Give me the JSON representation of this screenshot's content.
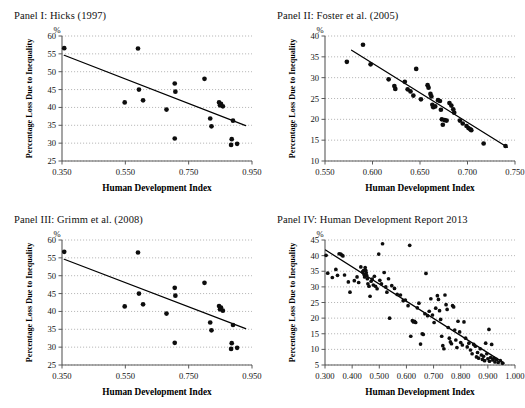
{
  "figure": {
    "common_xlabel": "Human Development Index",
    "common_ylabel": "Percentage Loss Due to Inequality",
    "percent_symbol": "%"
  },
  "chart_data": [
    {
      "type": "scatter",
      "panel_id": "I",
      "title": "Panel I: Hicks (1997)",
      "xlabel": "Human Development Index",
      "ylabel": "Percentage Loss Due to Inequality",
      "y_unit": "%",
      "xlim": [
        0.35,
        0.95
      ],
      "ylim": [
        25,
        60
      ],
      "xticks": [
        "0.350",
        "0.550",
        "0.750",
        "0.950"
      ],
      "xtick_values": [
        0.35,
        0.55,
        0.75,
        0.95
      ],
      "yticks": [
        "25",
        "30",
        "35",
        "40",
        "45",
        "50",
        "55",
        "60"
      ],
      "ytick_values": [
        25,
        30,
        35,
        40,
        45,
        50,
        55,
        60
      ],
      "grid": true,
      "grid_axis": "y",
      "legend": "none",
      "trendline": {
        "x": [
          0.357,
          0.93
        ],
        "y": [
          54.6,
          34.9
        ]
      },
      "points": [
        {
          "x": 0.357,
          "y": 56.6
        },
        {
          "x": 0.548,
          "y": 41.4
        },
        {
          "x": 0.59,
          "y": 56.5
        },
        {
          "x": 0.593,
          "y": 45.0
        },
        {
          "x": 0.606,
          "y": 42.0
        },
        {
          "x": 0.68,
          "y": 39.4
        },
        {
          "x": 0.706,
          "y": 46.7
        },
        {
          "x": 0.708,
          "y": 44.4
        },
        {
          "x": 0.706,
          "y": 31.3
        },
        {
          "x": 0.8,
          "y": 48.0
        },
        {
          "x": 0.818,
          "y": 36.9
        },
        {
          "x": 0.822,
          "y": 34.7
        },
        {
          "x": 0.846,
          "y": 41.4
        },
        {
          "x": 0.852,
          "y": 41.0
        },
        {
          "x": 0.849,
          "y": 40.6
        },
        {
          "x": 0.858,
          "y": 40.3
        },
        {
          "x": 0.89,
          "y": 36.3
        },
        {
          "x": 0.886,
          "y": 31.1
        },
        {
          "x": 0.884,
          "y": 29.5
        },
        {
          "x": 0.903,
          "y": 29.8
        }
      ]
    },
    {
      "type": "scatter",
      "panel_id": "II",
      "title": "Panel II: Foster et al. (2005)",
      "xlabel": "Human Development Index",
      "ylabel": "Percentage Loss Due to Inequality",
      "y_unit": "%",
      "xlim": [
        0.55,
        0.75
      ],
      "ylim": [
        10,
        40
      ],
      "xticks": [
        "0.550",
        "0.600",
        "0.650",
        "0.700",
        "0.750"
      ],
      "xtick_values": [
        0.55,
        0.6,
        0.65,
        0.7,
        0.75
      ],
      "yticks": [
        "10",
        "15",
        "20",
        "25",
        "30",
        "35",
        "40"
      ],
      "ytick_values": [
        10,
        15,
        20,
        25,
        30,
        35,
        40
      ],
      "grid": true,
      "grid_axis": "y",
      "legend": "none",
      "trendline": {
        "x": [
          0.578,
          0.742
        ],
        "y": [
          36.6,
          13.3
        ]
      },
      "points": [
        {
          "x": 0.573,
          "y": 33.8
        },
        {
          "x": 0.59,
          "y": 37.9
        },
        {
          "x": 0.598,
          "y": 33.2
        },
        {
          "x": 0.617,
          "y": 29.6
        },
        {
          "x": 0.623,
          "y": 28.0
        },
        {
          "x": 0.624,
          "y": 27.3
        },
        {
          "x": 0.634,
          "y": 29.0
        },
        {
          "x": 0.637,
          "y": 27.2
        },
        {
          "x": 0.64,
          "y": 26.7
        },
        {
          "x": 0.643,
          "y": 25.7
        },
        {
          "x": 0.646,
          "y": 32.1
        },
        {
          "x": 0.651,
          "y": 24.8
        },
        {
          "x": 0.658,
          "y": 28.2
        },
        {
          "x": 0.659,
          "y": 27.6
        },
        {
          "x": 0.661,
          "y": 26.1
        },
        {
          "x": 0.662,
          "y": 25.5
        },
        {
          "x": 0.663,
          "y": 23.5
        },
        {
          "x": 0.664,
          "y": 22.9
        },
        {
          "x": 0.666,
          "y": 23.1
        },
        {
          "x": 0.669,
          "y": 24.6
        },
        {
          "x": 0.671,
          "y": 24.4
        },
        {
          "x": 0.672,
          "y": 22.3
        },
        {
          "x": 0.673,
          "y": 20.0
        },
        {
          "x": 0.674,
          "y": 18.7
        },
        {
          "x": 0.676,
          "y": 19.8
        },
        {
          "x": 0.678,
          "y": 19.7
        },
        {
          "x": 0.681,
          "y": 23.9
        },
        {
          "x": 0.683,
          "y": 23.3
        },
        {
          "x": 0.685,
          "y": 22.4
        },
        {
          "x": 0.686,
          "y": 21.6
        },
        {
          "x": 0.692,
          "y": 19.7
        },
        {
          "x": 0.695,
          "y": 19.0
        },
        {
          "x": 0.699,
          "y": 18.4
        },
        {
          "x": 0.701,
          "y": 17.9
        },
        {
          "x": 0.703,
          "y": 17.6
        },
        {
          "x": 0.704,
          "y": 17.4
        },
        {
          "x": 0.717,
          "y": 14.2
        },
        {
          "x": 0.74,
          "y": 13.6
        }
      ]
    },
    {
      "type": "scatter",
      "panel_id": "III",
      "title": "Panel III: Grimm et al. (2008)",
      "xlabel": "Human Development Index",
      "ylabel": "Percentage Loss Due to Inequality",
      "y_unit": "%",
      "xlim": [
        0.35,
        0.95
      ],
      "ylim": [
        25,
        60
      ],
      "xticks": [
        "0.350",
        "0.550",
        "0.750",
        "0.950"
      ],
      "xtick_values": [
        0.35,
        0.55,
        0.75,
        0.95
      ],
      "yticks": [
        "25",
        "30",
        "35",
        "40",
        "45",
        "50",
        "55",
        "60"
      ],
      "ytick_values": [
        25,
        30,
        35,
        40,
        45,
        50,
        55,
        60
      ],
      "grid": true,
      "grid_axis": "y",
      "legend": "none",
      "trendline": {
        "x": [
          0.357,
          0.93
        ],
        "y": [
          54.6,
          35.2
        ]
      },
      "points": [
        {
          "x": 0.357,
          "y": 56.7
        },
        {
          "x": 0.548,
          "y": 41.4
        },
        {
          "x": 0.59,
          "y": 56.5
        },
        {
          "x": 0.593,
          "y": 45.0
        },
        {
          "x": 0.606,
          "y": 42.0
        },
        {
          "x": 0.68,
          "y": 39.4
        },
        {
          "x": 0.706,
          "y": 46.6
        },
        {
          "x": 0.708,
          "y": 44.4
        },
        {
          "x": 0.706,
          "y": 31.2
        },
        {
          "x": 0.8,
          "y": 48.0
        },
        {
          "x": 0.818,
          "y": 36.9
        },
        {
          "x": 0.822,
          "y": 34.7
        },
        {
          "x": 0.846,
          "y": 41.5
        },
        {
          "x": 0.852,
          "y": 41.1
        },
        {
          "x": 0.849,
          "y": 40.6
        },
        {
          "x": 0.858,
          "y": 40.2
        },
        {
          "x": 0.89,
          "y": 36.2
        },
        {
          "x": 0.886,
          "y": 31.1
        },
        {
          "x": 0.884,
          "y": 29.5
        },
        {
          "x": 0.903,
          "y": 29.8
        }
      ]
    },
    {
      "type": "scatter",
      "panel_id": "IV",
      "title": "Panel IV: Human Development Report 2013",
      "xlabel": "Human Development Index",
      "ylabel": "Percentage Loss Due to Inequality",
      "y_unit": "%",
      "xlim": [
        0.3,
        1.0
      ],
      "ylim": [
        5,
        45
      ],
      "xticks": [
        "0.300",
        "0.400",
        "0.500",
        "0.600",
        "0.700",
        "0.800",
        "0.900",
        "1.000"
      ],
      "xtick_values": [
        0.3,
        0.4,
        0.5,
        0.6,
        0.7,
        0.8,
        0.9,
        1.0
      ],
      "yticks": [
        "5",
        "10",
        "15",
        "20",
        "25",
        "30",
        "35",
        "40",
        "45"
      ],
      "ytick_values": [
        5,
        10,
        15,
        20,
        25,
        30,
        35,
        40,
        45
      ],
      "grid": true,
      "grid_axis": "y",
      "legend": "none",
      "trendline": {
        "x": [
          0.302,
          0.96
        ],
        "y": [
          41.8,
          5.6
        ]
      },
      "points": [
        {
          "x": 0.304,
          "y": 40.1
        },
        {
          "x": 0.31,
          "y": 34.4
        },
        {
          "x": 0.327,
          "y": 33.0
        },
        {
          "x": 0.34,
          "y": 35.6
        },
        {
          "x": 0.346,
          "y": 33.7
        },
        {
          "x": 0.352,
          "y": 40.6
        },
        {
          "x": 0.358,
          "y": 40.5
        },
        {
          "x": 0.362,
          "y": 40.2
        },
        {
          "x": 0.366,
          "y": 39.9
        },
        {
          "x": 0.372,
          "y": 33.8
        },
        {
          "x": 0.386,
          "y": 31.6
        },
        {
          "x": 0.392,
          "y": 28.3
        },
        {
          "x": 0.408,
          "y": 32.0
        },
        {
          "x": 0.418,
          "y": 33.2
        },
        {
          "x": 0.424,
          "y": 31.4
        },
        {
          "x": 0.432,
          "y": 36.4
        },
        {
          "x": 0.438,
          "y": 34.8
        },
        {
          "x": 0.442,
          "y": 35.2
        },
        {
          "x": 0.444,
          "y": 34.0
        },
        {
          "x": 0.446,
          "y": 33.2
        },
        {
          "x": 0.448,
          "y": 36.2
        },
        {
          "x": 0.45,
          "y": 35.3
        },
        {
          "x": 0.452,
          "y": 34.5
        },
        {
          "x": 0.454,
          "y": 33.6
        },
        {
          "x": 0.456,
          "y": 32.6
        },
        {
          "x": 0.458,
          "y": 31.0
        },
        {
          "x": 0.462,
          "y": 30.2
        },
        {
          "x": 0.466,
          "y": 27.0
        },
        {
          "x": 0.47,
          "y": 31.8
        },
        {
          "x": 0.474,
          "y": 32.5
        },
        {
          "x": 0.478,
          "y": 30.6
        },
        {
          "x": 0.482,
          "y": 33.4
        },
        {
          "x": 0.486,
          "y": 30.2
        },
        {
          "x": 0.492,
          "y": 29.4
        },
        {
          "x": 0.498,
          "y": 40.5
        },
        {
          "x": 0.502,
          "y": 32.1
        },
        {
          "x": 0.508,
          "y": 31.0
        },
        {
          "x": 0.512,
          "y": 43.8
        },
        {
          "x": 0.518,
          "y": 34.6
        },
        {
          "x": 0.524,
          "y": 30.0
        },
        {
          "x": 0.528,
          "y": 28.3
        },
        {
          "x": 0.534,
          "y": 32.6
        },
        {
          "x": 0.538,
          "y": 20.0
        },
        {
          "x": 0.546,
          "y": 30.4
        },
        {
          "x": 0.556,
          "y": 29.5
        },
        {
          "x": 0.566,
          "y": 27.6
        },
        {
          "x": 0.578,
          "y": 27.4
        },
        {
          "x": 0.588,
          "y": 25.6
        },
        {
          "x": 0.596,
          "y": 25.8
        },
        {
          "x": 0.606,
          "y": 24.0
        },
        {
          "x": 0.612,
          "y": 43.3
        },
        {
          "x": 0.616,
          "y": 14.2
        },
        {
          "x": 0.622,
          "y": 19.2
        },
        {
          "x": 0.626,
          "y": 18.8
        },
        {
          "x": 0.63,
          "y": 19.0
        },
        {
          "x": 0.634,
          "y": 18.6
        },
        {
          "x": 0.64,
          "y": 23.3
        },
        {
          "x": 0.646,
          "y": 24.8
        },
        {
          "x": 0.652,
          "y": 11.7
        },
        {
          "x": 0.658,
          "y": 15.0
        },
        {
          "x": 0.662,
          "y": 14.8
        },
        {
          "x": 0.668,
          "y": 21.4
        },
        {
          "x": 0.672,
          "y": 34.3
        },
        {
          "x": 0.678,
          "y": 20.8
        },
        {
          "x": 0.684,
          "y": 22.2
        },
        {
          "x": 0.69,
          "y": 26.2
        },
        {
          "x": 0.696,
          "y": 21.0
        },
        {
          "x": 0.702,
          "y": 18.6
        },
        {
          "x": 0.708,
          "y": 23.2
        },
        {
          "x": 0.714,
          "y": 27.2
        },
        {
          "x": 0.718,
          "y": 26.0
        },
        {
          "x": 0.722,
          "y": 22.4
        },
        {
          "x": 0.726,
          "y": 19.6
        },
        {
          "x": 0.73,
          "y": 14.2
        },
        {
          "x": 0.734,
          "y": 11.2
        },
        {
          "x": 0.738,
          "y": 10.2
        },
        {
          "x": 0.742,
          "y": 27.4
        },
        {
          "x": 0.746,
          "y": 24.3
        },
        {
          "x": 0.75,
          "y": 22.8
        },
        {
          "x": 0.754,
          "y": 17.0
        },
        {
          "x": 0.758,
          "y": 13.6
        },
        {
          "x": 0.762,
          "y": 12.4
        },
        {
          "x": 0.766,
          "y": 11.8
        },
        {
          "x": 0.77,
          "y": 24.0
        },
        {
          "x": 0.774,
          "y": 23.6
        },
        {
          "x": 0.778,
          "y": 16.2
        },
        {
          "x": 0.782,
          "y": 13.0
        },
        {
          "x": 0.786,
          "y": 10.6
        },
        {
          "x": 0.79,
          "y": 19.0
        },
        {
          "x": 0.796,
          "y": 15.6
        },
        {
          "x": 0.8,
          "y": 12.2
        },
        {
          "x": 0.806,
          "y": 11.4
        },
        {
          "x": 0.812,
          "y": 18.8
        },
        {
          "x": 0.818,
          "y": 13.6
        },
        {
          "x": 0.824,
          "y": 10.8
        },
        {
          "x": 0.83,
          "y": 12.0
        },
        {
          "x": 0.836,
          "y": 9.8
        },
        {
          "x": 0.842,
          "y": 8.6
        },
        {
          "x": 0.848,
          "y": 11.6
        },
        {
          "x": 0.854,
          "y": 11.0
        },
        {
          "x": 0.858,
          "y": 7.6
        },
        {
          "x": 0.862,
          "y": 9.0
        },
        {
          "x": 0.866,
          "y": 7.2
        },
        {
          "x": 0.872,
          "y": 10.2
        },
        {
          "x": 0.876,
          "y": 8.2
        },
        {
          "x": 0.88,
          "y": 6.8
        },
        {
          "x": 0.884,
          "y": 7.8
        },
        {
          "x": 0.888,
          "y": 6.4
        },
        {
          "x": 0.892,
          "y": 12.0
        },
        {
          "x": 0.896,
          "y": 8.6
        },
        {
          "x": 0.9,
          "y": 7.0
        },
        {
          "x": 0.904,
          "y": 16.4
        },
        {
          "x": 0.906,
          "y": 6.2
        },
        {
          "x": 0.91,
          "y": 7.4
        },
        {
          "x": 0.914,
          "y": 11.6
        },
        {
          "x": 0.918,
          "y": 6.6
        },
        {
          "x": 0.922,
          "y": 7.2
        },
        {
          "x": 0.926,
          "y": 6.0
        },
        {
          "x": 0.932,
          "y": 6.8
        },
        {
          "x": 0.938,
          "y": 5.8
        },
        {
          "x": 0.946,
          "y": 6.4
        },
        {
          "x": 0.954,
          "y": 5.6
        }
      ]
    }
  ]
}
